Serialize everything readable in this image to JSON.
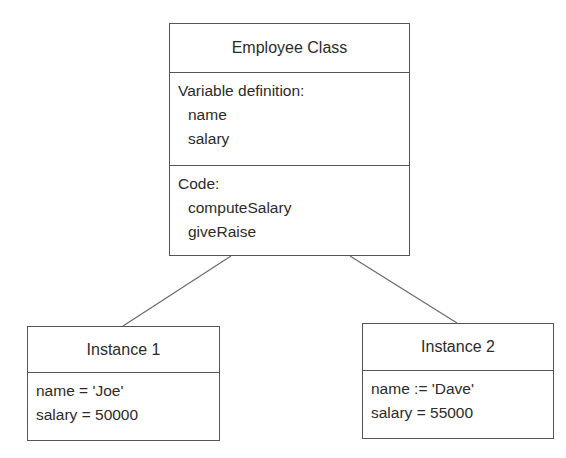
{
  "diagram": {
    "class_box": {
      "title": "Employee Class",
      "variables_header": "Variable definition:",
      "variables": [
        "name",
        "salary"
      ],
      "code_header": "Code:",
      "methods": [
        "computeSalary",
        "giveRaise"
      ]
    },
    "instances": [
      {
        "title": "Instance 1",
        "fields": [
          "name = 'Joe'",
          "salary = 50000"
        ]
      },
      {
        "title": "Instance 2",
        "fields": [
          "name := 'Dave'",
          "salary = 55000"
        ]
      }
    ],
    "connectors": [
      {
        "from": "Employee Class",
        "to": "Instance 1"
      },
      {
        "from": "Employee Class",
        "to": "Instance 2"
      }
    ],
    "colors": {
      "stroke": "#555555",
      "text": "#2b2b2b",
      "background": "#ffffff"
    }
  }
}
